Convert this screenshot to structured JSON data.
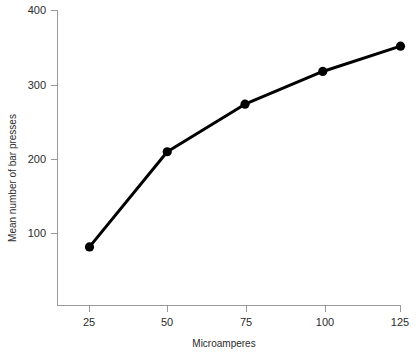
{
  "chart_data": {
    "type": "line",
    "title": "",
    "xlabel": "Microamperes",
    "ylabel": "Mean number of bar presses",
    "x": [
      25,
      50,
      75,
      100,
      125
    ],
    "values": [
      82,
      210,
      274,
      318,
      352
    ],
    "series": [
      {
        "name": "Mean number of bar presses",
        "values": [
          82,
          210,
          274,
          318,
          352
        ]
      }
    ],
    "xticks": [
      25,
      50,
      75,
      100,
      125
    ],
    "xtick_labels": [
      "25",
      "50",
      "75",
      "100",
      "125"
    ],
    "yticks": [
      100,
      200,
      300,
      400
    ],
    "ytick_labels": [
      "100",
      "200",
      "300",
      "400"
    ],
    "xlim": [
      12.5,
      125
    ],
    "ylim": [
      0,
      400
    ],
    "grid": false,
    "legend": false,
    "marker": "filled-circle",
    "line_color": "#000000",
    "axis_color": "#9a9a9a",
    "text_color": "#2b2b2b",
    "background": "#ffffff"
  },
  "axes": {
    "x_title": "Microamperes",
    "y_title": "Mean number of bar presses",
    "x_tick_0": "25",
    "x_tick_1": "50",
    "x_tick_2": "75",
    "x_tick_3": "100",
    "x_tick_4": "125",
    "y_tick_0": "100",
    "y_tick_1": "200",
    "y_tick_2": "300",
    "y_tick_3": "400"
  }
}
